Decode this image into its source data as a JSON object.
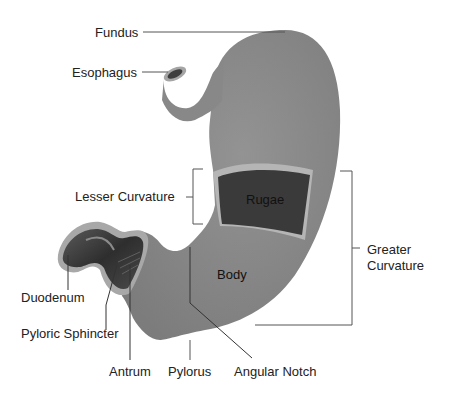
{
  "diagram": {
    "colors": {
      "stomach": "#8a8a8a",
      "stomach_dark": "#6f6f6f",
      "rugae": "#3a3a3a",
      "mucosa_edge": "#b5b5b5",
      "duodenum_inner": "#4a4a4a",
      "leader": "#555555",
      "text": "#222222"
    },
    "labels": {
      "fundus": "Fundus",
      "esophagus": "Esophagus",
      "lesser_curvature": "Lesser Curvature",
      "rugae": "Rugae",
      "greater_curvature_line1": "Greater",
      "greater_curvature_line2": "Curvature",
      "body": "Body",
      "duodenum": "Duodenum",
      "pyloric_sphincter": "Pyloric Sphincter",
      "antrum": "Antrum",
      "pylorus": "Pylorus",
      "angular_notch": "Angular Notch"
    }
  }
}
